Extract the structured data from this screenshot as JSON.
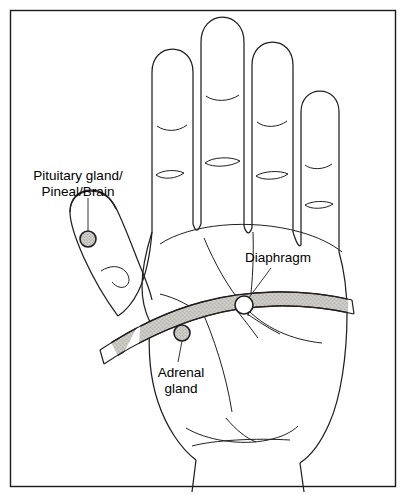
{
  "figure": {
    "view": "left palm, fingers upward",
    "background_color": "#ffffff",
    "ink_color": "#231f20",
    "frame_color": "#1a1a1a"
  },
  "labels": {
    "pituitary": {
      "line1": "Pituitary gland/",
      "line2": "Pineal/Brain",
      "x": 78,
      "y": 180,
      "marker_x": 88,
      "marker_y": 239,
      "marker_r": 8
    },
    "diaphragm": {
      "line1": "Diaphragm",
      "x": 278,
      "y": 260,
      "marker_x": 244,
      "marker_y": 305,
      "marker_r": 9
    },
    "adrenal": {
      "line1": "Adrenal",
      "line2": "gland",
      "x": 181,
      "y": 376,
      "marker_x": 182,
      "marker_y": 333,
      "marker_r": 8
    }
  },
  "zones": {
    "diaphragm_band": {
      "name": "Diaphragm line",
      "fill_color": "#c9c7c2",
      "texture": "stipple"
    }
  },
  "marker_colors": {
    "pituitary_fill": "#cfcdc8",
    "adrenal_fill": "#cfcdc8",
    "diaphragm_fill": "#ffffff"
  }
}
